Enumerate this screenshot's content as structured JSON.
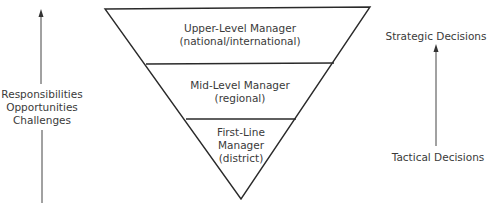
{
  "diagram": {
    "type": "inverted-pyramid",
    "line_color": "#2a2a2a",
    "levels": [
      {
        "title": "Upper-Level Manager",
        "scope": "(national/international)"
      },
      {
        "title": "Mid-Level Manager",
        "scope": "(regional)"
      },
      {
        "title_line1": "First-Line",
        "title_line2": "Manager",
        "scope": "(district)"
      }
    ],
    "left_axis": {
      "direction": "up",
      "labels": [
        "Responsibilities",
        "Opportunities",
        "Challenges"
      ]
    },
    "right_axis": {
      "direction": "up",
      "top_label": "Strategic Decisions",
      "bottom_label": "Tactical Decisions"
    }
  }
}
